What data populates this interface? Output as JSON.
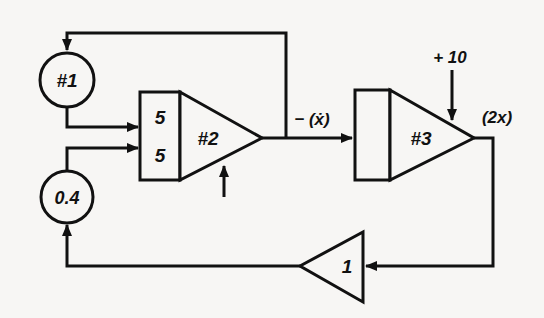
{
  "diagram": {
    "type": "analog-computer-block-diagram",
    "nodes": {
      "pot1": {
        "label": "#1",
        "kind": "potentiometer"
      },
      "pot2": {
        "label": "0.4",
        "kind": "potentiometer"
      },
      "integrator2": {
        "label": "#2",
        "kind": "integrator",
        "input_gains": [
          "5",
          "5"
        ]
      },
      "integrator3": {
        "label": "#3",
        "kind": "integrator",
        "initial_condition": "+ 10"
      },
      "inverter": {
        "label": "1",
        "kind": "inverter"
      }
    },
    "signals": {
      "int2_output": "− (ẋ)",
      "int3_output": "(2x)"
    },
    "connections": [
      {
        "from": "integrator2",
        "to": "integrator3",
        "label": "− (ẋ)"
      },
      {
        "from": "integrator2",
        "to": "pot1",
        "via": "top feedback"
      },
      {
        "from": "pot1",
        "to": "integrator2",
        "input": "upper"
      },
      {
        "from": "pot2",
        "to": "integrator2",
        "input": "lower"
      },
      {
        "from": "integrator3",
        "to": "inverter",
        "label": "(2x)"
      },
      {
        "from": "inverter",
        "to": "pot2"
      }
    ]
  }
}
